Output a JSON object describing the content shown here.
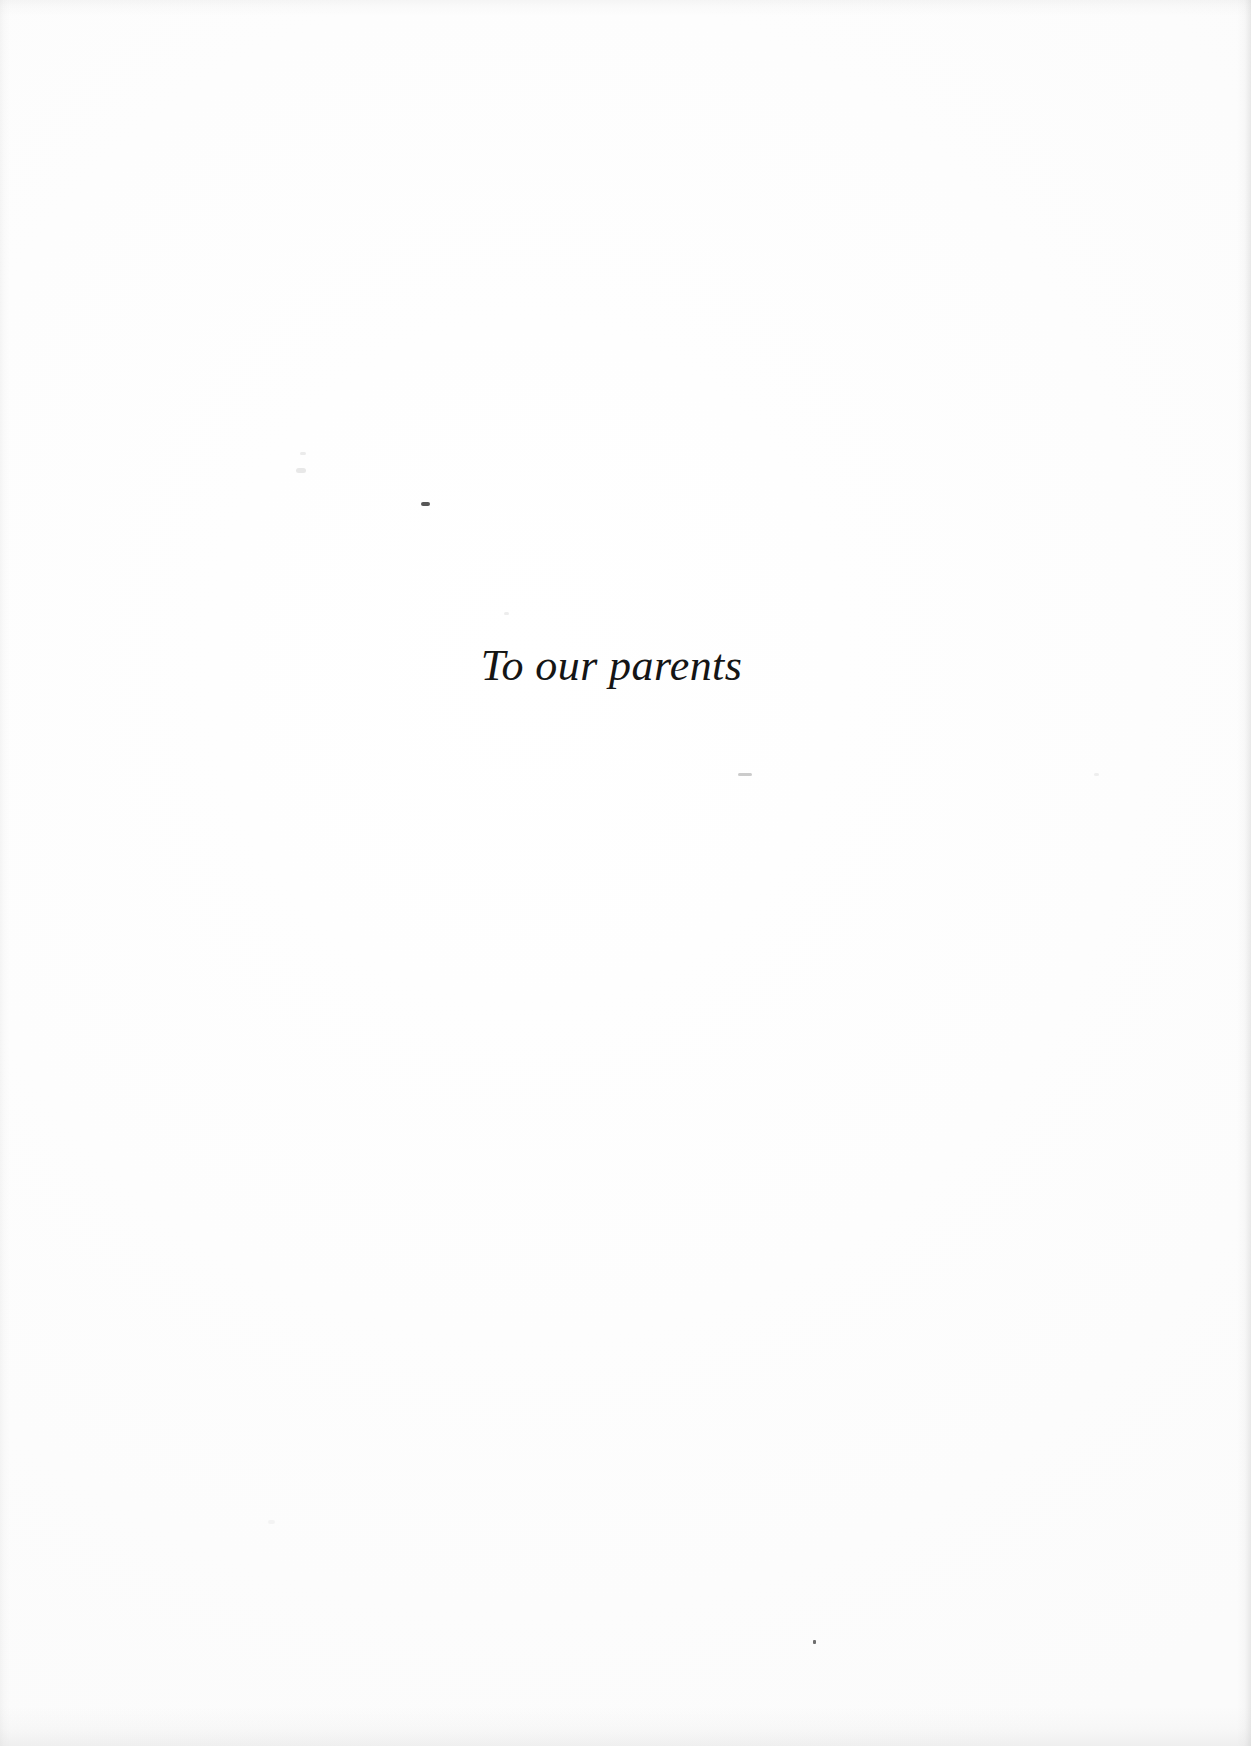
{
  "page": {
    "kind": "book-dedication-page",
    "width": 1251,
    "height": 1746,
    "background_color": "#fdfdfd",
    "text_color": "#151515"
  },
  "dedication": {
    "text": "To our parents",
    "style": "italic-serif",
    "alignment": "center"
  },
  "artifacts": {
    "description": "faint scanner dust specks and page-edge shading",
    "speck_color_dark": "#3a3a3a",
    "speck_color_light": "#b9b9b9",
    "edge_shade_color": "#bababa"
  }
}
